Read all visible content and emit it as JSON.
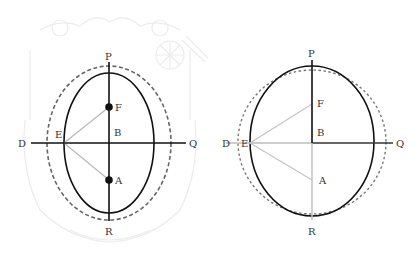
{
  "colors": {
    "ink": "#111111",
    "gray_line": "#b8b8b8",
    "dashed": "#666666",
    "watermark": "#ececec",
    "label": "#333333"
  },
  "left_diagram": {
    "labels": {
      "P": "P",
      "R": "R",
      "D": "D",
      "Q": "Q",
      "E": "E",
      "B": "B",
      "F": "F",
      "A": "A"
    },
    "points": {
      "B": [
        109,
        143
      ],
      "F": [
        109,
        107
      ],
      "A": [
        109,
        180
      ],
      "E": [
        64,
        143
      ]
    },
    "solid_ellipse": {
      "cx": 109,
      "cy": 143,
      "rx": 45,
      "ry": 70
    },
    "dashed_ellipse": {
      "cx": 109,
      "cy": 143,
      "rx": 62,
      "ry": 77
    },
    "foci_marked": true
  },
  "right_diagram": {
    "labels": {
      "P": "P",
      "R": "R",
      "D": "D",
      "Q": "Q",
      "E": "E",
      "B": "B",
      "F": "F",
      "A": "A"
    },
    "points": {
      "B": [
        312,
        143
      ],
      "F": [
        312,
        104
      ],
      "A": [
        312,
        180
      ],
      "E": [
        250,
        143
      ]
    },
    "solid_ellipse": {
      "cx": 312,
      "cy": 141,
      "rx": 62,
      "ry": 75
    },
    "dashed_ellipse": {
      "cx": 312,
      "cy": 142,
      "rx": 74,
      "ry": 72
    },
    "foci_marked": false
  }
}
